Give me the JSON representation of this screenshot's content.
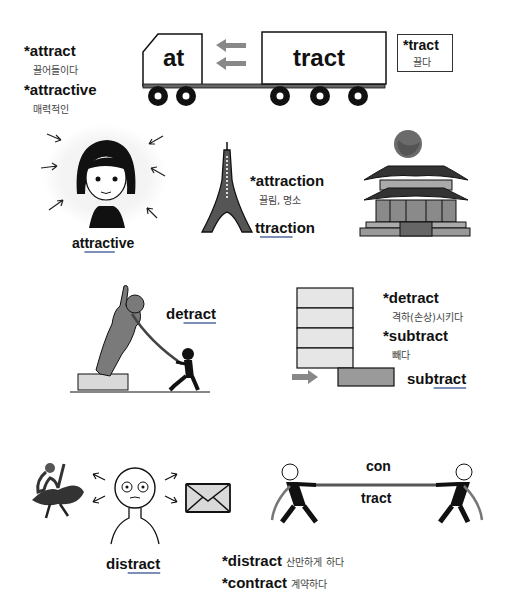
{
  "section1": {
    "entries": [
      {
        "word": "*attract",
        "meaning": "끌어들이다"
      },
      {
        "word": "*attractive",
        "meaning": "매력적인"
      }
    ],
    "truck": {
      "cab_label": "at",
      "trailer_label": "tract"
    },
    "box": {
      "word": "*tract",
      "meaning": "끌다"
    }
  },
  "section2": {
    "face_caption": {
      "prefix": "at",
      "root": "tract",
      "suffix": "ive"
    },
    "entry": {
      "word": "*attraction",
      "meaning": "끌림, 명소"
    },
    "tower_caption": {
      "prefix": "",
      "root": "tract",
      "suffix": "ion",
      "lead": "t"
    }
  },
  "section3": {
    "statue_caption": {
      "prefix": "de",
      "root": "tract",
      "suffix": ""
    },
    "entries": [
      {
        "word": "*detract",
        "meaning": "격하(손상)시키다"
      },
      {
        "word": "*subtract",
        "meaning": "빼다"
      }
    ],
    "blocks_caption": {
      "prefix": "sub",
      "root": "tract",
      "suffix": ""
    }
  },
  "section4": {
    "person_caption": {
      "prefix": "dis",
      "root": "tract",
      "suffix": ""
    },
    "tug_top": "con",
    "tug_bottom": "tract",
    "entries": [
      {
        "word": "*distract",
        "meaning": "산만하게 하다"
      },
      {
        "word": "*contract",
        "meaning": "계약하다"
      }
    ]
  },
  "colors": {
    "text": "#111111",
    "meaning": "#444444",
    "underline": "#7b8fb8",
    "arrow_gray": "#888888",
    "block_light": "#e6e6e6",
    "block_dark": "#9a9a9a"
  }
}
